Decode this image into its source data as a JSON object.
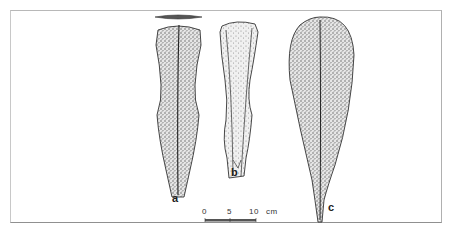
{
  "figure": {
    "artifacts": [
      {
        "label": "a"
      },
      {
        "label": "b"
      },
      {
        "label": "c"
      }
    ],
    "scale_bar": {
      "ticks": [
        "0",
        "5",
        "10"
      ],
      "unit": "cm"
    }
  }
}
